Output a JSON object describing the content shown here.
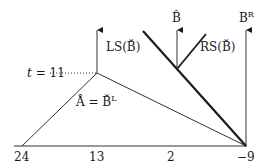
{
  "diagram": {
    "colors": {
      "ink": "#1a1a1a",
      "thin": "#333333",
      "background": "#ffffff"
    },
    "axis": {
      "ticks": [
        {
          "label": "24",
          "x": 22
        },
        {
          "label": "13",
          "x": 97
        },
        {
          "label": "2",
          "x": 171
        },
        {
          "label": "−9",
          "x": 246
        }
      ]
    },
    "labels": {
      "t_var": "t",
      "t_eq": "= 11",
      "ls": "LS(B̆)",
      "rs": "RS(B̆)",
      "b_hat": "B̂",
      "b_r_base": "B",
      "b_r_sup": "R",
      "a_eq_base": "Å = B̆",
      "a_eq_sup": "L"
    }
  }
}
